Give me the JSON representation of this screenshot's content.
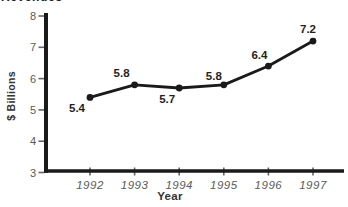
{
  "figure": {
    "clipped_title": "Revenues"
  },
  "chart_data": {
    "type": "line",
    "title": "Revenues",
    "xlabel": "Year",
    "ylabel": "$ Billions",
    "categories": [
      "1992",
      "1993",
      "1994",
      "1995",
      "1996",
      "1997"
    ],
    "values": [
      5.4,
      5.8,
      5.7,
      5.8,
      6.4,
      7.2
    ],
    "point_labels": [
      "5.4",
      "5.8",
      "5.7",
      "5.8",
      "6.4",
      "7.2"
    ],
    "ylim": [
      3,
      8
    ],
    "y_ticks": [
      3,
      4,
      5,
      6,
      7,
      8
    ],
    "grid": false,
    "legend": false,
    "colors": {
      "line": "#1a1a1a",
      "marker": "#1a1a1a",
      "axis": "#1a1a1a",
      "tick": "#666666",
      "tick_label": "#5a5a5a",
      "data_label": "#1f1f1f"
    },
    "label_offsets": [
      [
        -13,
        11
      ],
      [
        -13,
        -12
      ],
      [
        -12,
        11
      ],
      [
        -10,
        -9
      ],
      [
        -9,
        -11
      ],
      [
        -5,
        -12
      ]
    ]
  }
}
